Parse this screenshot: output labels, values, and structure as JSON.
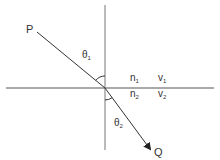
{
  "diagram": {
    "type": "refraction",
    "labels": {
      "incident_point": "P",
      "refracted_point": "Q",
      "theta1": "θ",
      "theta1_sub": "1",
      "theta2": "θ",
      "theta2_sub": "2",
      "n1": "n",
      "n1_sub": "1",
      "v1": "v",
      "v1_sub": "1",
      "n2": "n",
      "n2_sub": "2",
      "v2": "v",
      "v2_sub": "2"
    },
    "colors": {
      "line": "#555555",
      "ray": "#333333",
      "text": "#333333"
    }
  }
}
